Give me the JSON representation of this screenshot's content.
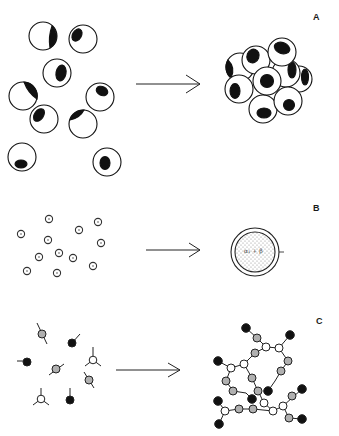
{
  "panels": [
    {
      "id": "A",
      "label": "A",
      "description": "Dispersed cells aggregate into a cell cluster"
    },
    {
      "id": "B",
      "label": "B",
      "description": "Dispersed small particles coalesce into an enclosed droplet"
    },
    {
      "id": "C",
      "label": "C",
      "description": "Free monomer units link into a branched polymer network"
    }
  ],
  "panel_b": {
    "droplet_text": "α₁ + β",
    "side_mark": "—"
  },
  "colors": {
    "ink": "#111111",
    "fill_light": "#ffffff",
    "fill_grey": "#b0b0b0",
    "stipple": "#888888"
  }
}
